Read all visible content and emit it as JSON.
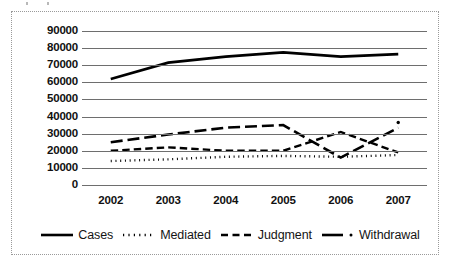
{
  "chart_data": {
    "type": "line",
    "title": "",
    "xlabel": "",
    "ylabel": "",
    "categories": [
      "2002",
      "2003",
      "2004",
      "2005",
      "2006",
      "2007"
    ],
    "ylim": [
      0,
      90000
    ],
    "ytick_step": 10000,
    "yticks": [
      "90000",
      "80000",
      "70000",
      "60000",
      "50000",
      "40000",
      "30000",
      "20000",
      "10000",
      "0"
    ],
    "ytick_values": [
      90000,
      80000,
      70000,
      60000,
      50000,
      40000,
      30000,
      20000,
      10000,
      0
    ],
    "grid": true,
    "grid_axis": "y",
    "legend_position": "bottom",
    "series": [
      {
        "name": "Cases",
        "style": "solid",
        "width": 2.6,
        "color": "#000000",
        "values": [
          62000,
          71500,
          75000,
          77500,
          75000,
          76500
        ]
      },
      {
        "name": "Mediated",
        "style": "dotted",
        "width": 2.4,
        "color": "#000000",
        "values": [
          14000,
          15000,
          16500,
          17000,
          16500,
          17500
        ]
      },
      {
        "name": "Judgment",
        "style": "dashed",
        "width": 2.4,
        "color": "#000000",
        "values": [
          20000,
          22000,
          20000,
          20000,
          31000,
          19000
        ]
      },
      {
        "name": "Withdrawal",
        "style": "dashdot",
        "width": 2.6,
        "color": "#000000",
        "values": [
          25000,
          29500,
          33500,
          35000,
          16000,
          33500
        ]
      }
    ],
    "annotations": [
      {
        "label": "marker-dot",
        "x": "2007",
        "y": 36500
      }
    ]
  },
  "legend": {
    "items": [
      {
        "label": "Cases",
        "style": "solid"
      },
      {
        "label": "Mediated",
        "style": "dotted"
      },
      {
        "label": "Judgment",
        "style": "dashed"
      },
      {
        "label": "Withdrawal",
        "style": "dashdot"
      }
    ]
  }
}
